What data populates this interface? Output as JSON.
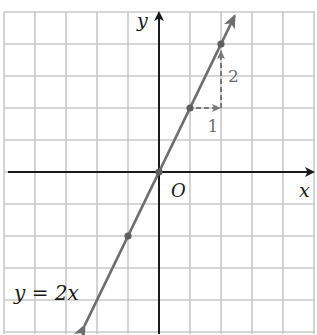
{
  "chart_data": {
    "type": "line",
    "title": "",
    "xlabel": "x",
    "ylabel": "y",
    "origin_label": "O",
    "equation_label": "y = 2x",
    "xlim": [
      -5,
      5
    ],
    "ylim": [
      -5,
      5
    ],
    "grid": true,
    "tick_labels_shown": false,
    "series": [
      {
        "name": "y = 2x",
        "slope": 2,
        "intercept": 0,
        "x": [
          -1,
          0,
          1,
          2
        ],
        "y": [
          -2,
          0,
          2,
          4
        ],
        "marked_points": [
          [
            -1,
            -2
          ],
          [
            0,
            0
          ],
          [
            1,
            2
          ],
          [
            2,
            4
          ]
        ],
        "arrows_both_ends": true
      }
    ],
    "annotations": [
      {
        "type": "run",
        "from": [
          1,
          2
        ],
        "to": [
          2,
          2
        ],
        "label": "1",
        "style": "dashed-arrow"
      },
      {
        "type": "rise",
        "from": [
          2,
          2
        ],
        "to": [
          2,
          4
        ],
        "label": "2",
        "style": "dashed-arrow"
      }
    ],
    "colors": {
      "grid": "#c8c8c8",
      "axes": "#1a1a1a",
      "line": "#6e6e6e",
      "annotation": "#7a7a7a"
    }
  }
}
